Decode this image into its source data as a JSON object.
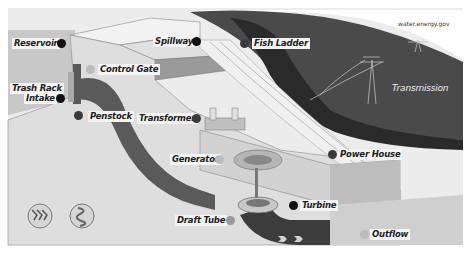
{
  "diagram": {
    "source_credit": "water.energy.gov",
    "labels": [
      {
        "id": "reservoir",
        "text": "Reservoir"
      },
      {
        "id": "control_gate",
        "text": "Control Gate"
      },
      {
        "id": "trash_rack",
        "text": "Trash Rack"
      },
      {
        "id": "intake",
        "text": "Intake"
      },
      {
        "id": "penstock",
        "text": "Penstock"
      },
      {
        "id": "spillway",
        "text": "Spillway"
      },
      {
        "id": "fish_ladder",
        "text": "Fish Ladder"
      },
      {
        "id": "transformer",
        "text": "Transformer"
      },
      {
        "id": "generator",
        "text": "Generator"
      },
      {
        "id": "power_house",
        "text": "Power House"
      },
      {
        "id": "turbine",
        "text": "Turbine"
      },
      {
        "id": "draft_tube",
        "text": "Draft Tube"
      },
      {
        "id": "outflow",
        "text": "Outflow"
      },
      {
        "id": "transmission",
        "text": "Transmission"
      }
    ],
    "icons": [
      {
        "name": "water-flow-icon"
      },
      {
        "name": "turbine-swirl-icon"
      }
    ],
    "colors": {
      "sky": "#ffffff",
      "water_dark": "#3c3c3c",
      "land": "#d8d8d8",
      "dam_face": "#e6e6e6",
      "penstock": "#5a5a5a"
    }
  }
}
